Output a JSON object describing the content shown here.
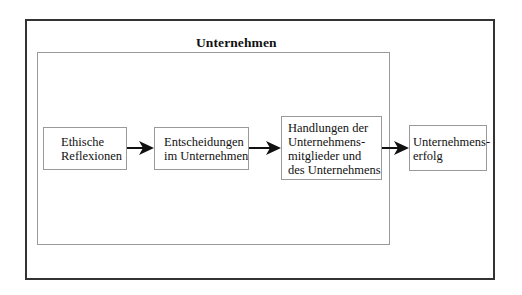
{
  "diagram": {
    "outer_frame": {},
    "inner_frame": {
      "title": "Unternehmen"
    },
    "boxes": [
      {
        "id": "ethische-reflexionen",
        "lines": [
          "Ethische",
          "Reflexionen"
        ]
      },
      {
        "id": "entscheidungen",
        "lines": [
          "Entscheidungen",
          "im Unternehmen"
        ]
      },
      {
        "id": "handlungen",
        "lines": [
          "Handlungen der",
          "Unternehmens-",
          "mitglieder und",
          "des Unternehmens"
        ]
      },
      {
        "id": "unternehmenserfolg",
        "lines": [
          "Unternehmens-",
          "erfolg"
        ]
      }
    ],
    "arrows": [
      {
        "from": "ethische-reflexionen",
        "to": "entscheidungen"
      },
      {
        "from": "entscheidungen",
        "to": "handlungen"
      },
      {
        "from": "handlungen",
        "to": "unternehmenserfolg"
      }
    ],
    "colors": {
      "outer_border": "#333333",
      "inner_border": "#9a9a9a",
      "arrow": "#111111"
    }
  }
}
